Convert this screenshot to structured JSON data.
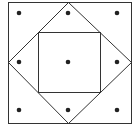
{
  "figure": {
    "stroke_color": "#333333",
    "dot_color": "#222222",
    "outer_square": {
      "x": 8,
      "y": 2,
      "width": 123,
      "height": 121
    },
    "diamond": {
      "top": [
        68,
        2
      ],
      "right": [
        131,
        62
      ],
      "bottom": [
        68,
        123
      ],
      "left": [
        8,
        62
      ]
    },
    "inner_square": {
      "x": 38,
      "y": 32,
      "width": 62,
      "height": 60
    },
    "dots": [
      {
        "cx": 19,
        "cy": 13
      },
      {
        "cx": 68,
        "cy": 13
      },
      {
        "cx": 117,
        "cy": 13
      },
      {
        "cx": 19,
        "cy": 62
      },
      {
        "cx": 68,
        "cy": 62
      },
      {
        "cx": 117,
        "cy": 62
      },
      {
        "cx": 19,
        "cy": 110
      },
      {
        "cx": 68,
        "cy": 110
      },
      {
        "cx": 117,
        "cy": 110
      }
    ],
    "dot_radius": 2.3
  }
}
